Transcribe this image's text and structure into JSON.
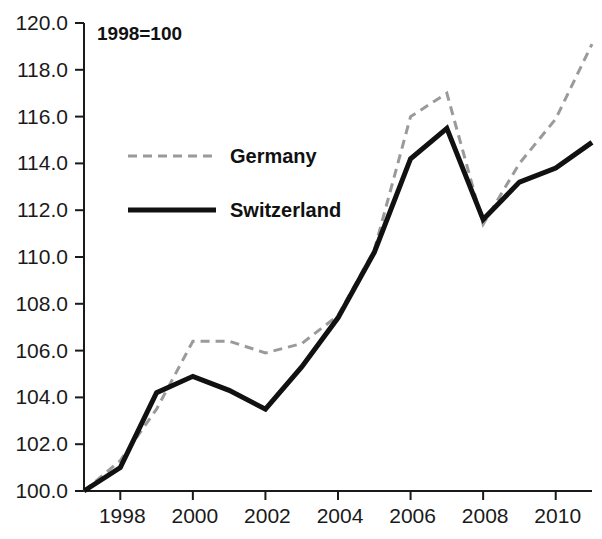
{
  "chart_data": {
    "type": "line",
    "title": "",
    "annotation": "1998=100",
    "xlabel": "",
    "ylabel": "",
    "xlim": [
      1997,
      2011
    ],
    "ylim": [
      100.0,
      120.0
    ],
    "ytick_step": 2.0,
    "grid": false,
    "legend_position": "inside-upper-left",
    "x": [
      1997,
      1998,
      1999,
      2000,
      2001,
      2002,
      2003,
      2004,
      2005,
      2006,
      2007,
      2008,
      2009,
      2010,
      2011
    ],
    "x_tick_labels": [
      "1998",
      "2000",
      "2002",
      "2004",
      "2006",
      "2008",
      "2010"
    ],
    "x_tick_values": [
      1998,
      2000,
      2002,
      2004,
      2006,
      2008,
      2010
    ],
    "y_tick_labels": [
      "100.0",
      "102.0",
      "104.0",
      "106.0",
      "108.0",
      "110.0",
      "112.0",
      "114.0",
      "116.0",
      "118.0",
      "120.0"
    ],
    "y_tick_values": [
      100.0,
      102.0,
      104.0,
      106.0,
      108.0,
      110.0,
      112.0,
      114.0,
      116.0,
      118.0,
      120.0
    ],
    "series": [
      {
        "name": "Germany",
        "style": "dashed",
        "color": "#9a9a9a",
        "values": [
          100.0,
          101.3,
          103.5,
          106.4,
          106.4,
          105.9,
          106.3,
          107.5,
          110.3,
          116.0,
          117.0,
          111.4,
          114.0,
          115.9,
          119.1
        ]
      },
      {
        "name": "Switzerland",
        "style": "solid",
        "color": "#111111",
        "values": [
          100.0,
          101.0,
          104.2,
          104.9,
          104.3,
          103.5,
          105.3,
          107.4,
          110.2,
          114.2,
          115.5,
          111.6,
          113.2,
          113.8,
          114.9
        ]
      }
    ]
  },
  "legend": {
    "items": [
      {
        "label": "Germany",
        "style": "dashed",
        "color": "#9a9a9a"
      },
      {
        "label": "Switzerland",
        "style": "solid",
        "color": "#111111"
      }
    ]
  },
  "axes": {
    "y_axis_name": "index-value-axis",
    "x_axis_name": "year-axis"
  }
}
